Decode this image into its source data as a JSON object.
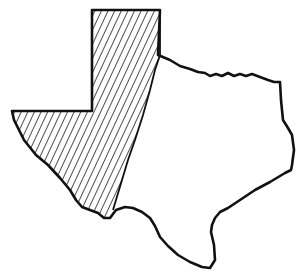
{
  "map": {
    "subject": "Texas",
    "regions": [
      {
        "name": "West Texas (hatched)",
        "style": "diagonal-hatch"
      },
      {
        "name": "Rest of Texas",
        "style": "blank"
      }
    ],
    "colors": {
      "outline": "#111111",
      "hatch": "#222222",
      "background": "#ffffff"
    }
  }
}
